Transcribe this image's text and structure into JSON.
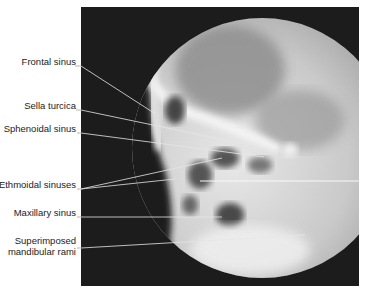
{
  "figure": {
    "labels": [
      {
        "id": "frontal",
        "text": "Frontal sinus"
      },
      {
        "id": "sella",
        "text": "Sella turcica"
      },
      {
        "id": "sphenoidal",
        "text": "Sphenoidal sinus"
      },
      {
        "id": "ethmoidal",
        "text": "Ethmoidal sinuses"
      },
      {
        "id": "maxillary",
        "text": "Maxillary sinus"
      },
      {
        "id": "mandibular_1",
        "text": "Superimposed"
      },
      {
        "id": "mandibular_2",
        "text": "mandibular rami"
      }
    ]
  }
}
